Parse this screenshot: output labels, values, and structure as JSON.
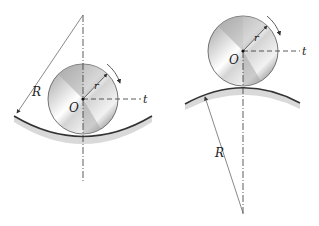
{
  "figures": [
    {
      "id": "concave",
      "description": "Wheel rolling inside a concave circular track",
      "labels": {
        "center": "O",
        "radius_wheel": "r",
        "radius_track": "R",
        "tangent": "t"
      }
    },
    {
      "id": "convex",
      "description": "Wheel rolling on top of a convex circular track",
      "labels": {
        "center": "O",
        "radius_wheel": "r",
        "radius_track": "R",
        "tangent": "t"
      }
    }
  ],
  "colors": {
    "line": "#333333",
    "wheel_edge": "#555555",
    "track": "#444444"
  }
}
